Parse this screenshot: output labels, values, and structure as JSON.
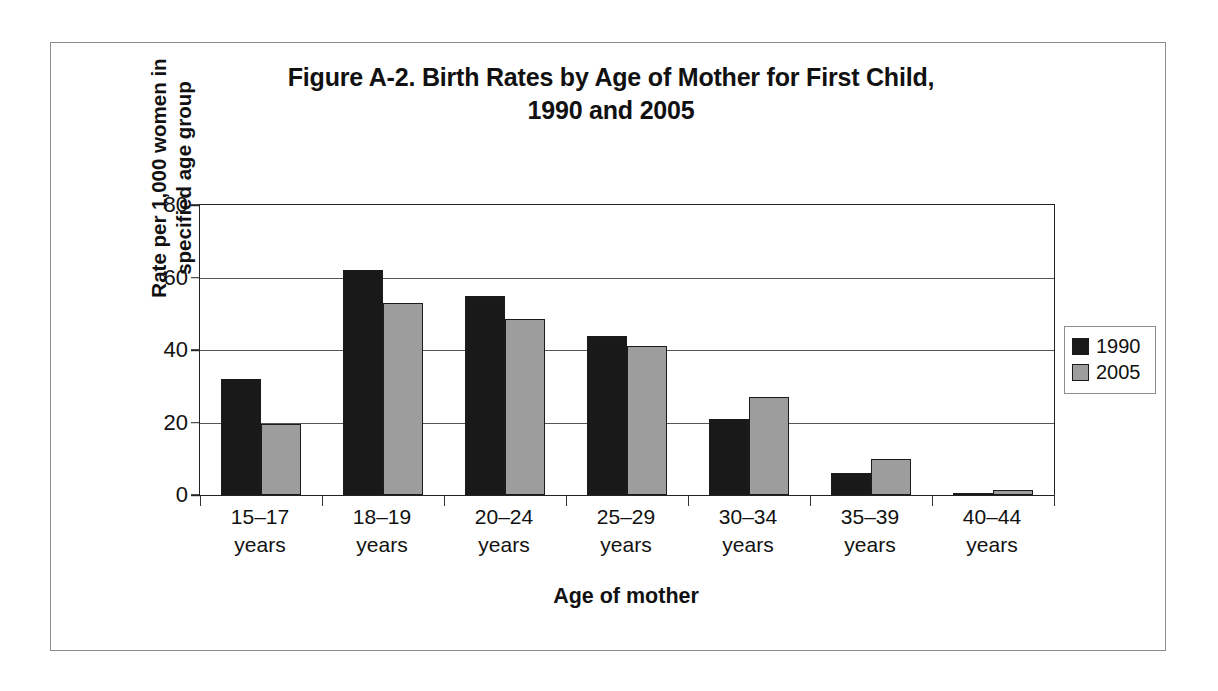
{
  "figure": {
    "title_line1": "Figure A-2. Birth Rates by Age of Mother for First Child,",
    "title_line2": "1990 and 2005",
    "y_axis_title_line1": "Rate per 1,000 women in",
    "y_axis_title_line2": "specified age group",
    "x_axis_title": "Age of mother"
  },
  "legend": {
    "position": "right",
    "items": [
      {
        "label": "1990",
        "color": "#191919"
      },
      {
        "label": "2005",
        "color": "#9d9d9d"
      }
    ]
  },
  "axis": {
    "y_ticks": [
      "80",
      "60",
      "40",
      "20",
      "0"
    ],
    "x_categories_line1": [
      "15–17",
      "18–19",
      "20–24",
      "25–29",
      "30–34",
      "35–39",
      "40–44"
    ],
    "x_categories_line2": [
      "years",
      "years",
      "years",
      "years",
      "years",
      "years",
      "years"
    ]
  },
  "chart_data": {
    "type": "bar",
    "title": "Figure A-2. Birth Rates by Age of Mother for First Child, 1990 and 2005",
    "xlabel": "Age of mother",
    "ylabel": "Rate per 1,000 women in specified age group",
    "ylim": [
      0,
      80
    ],
    "yticks": [
      0,
      20,
      40,
      60,
      80
    ],
    "grid": true,
    "legend_position": "right",
    "categories": [
      "15–17 years",
      "18–19 years",
      "20–24 years",
      "25–29 years",
      "30–34 years",
      "35–39 years",
      "40–44 years"
    ],
    "series": [
      {
        "name": "1990",
        "color": "#191919",
        "values": [
          32,
          62,
          55,
          44,
          21,
          6,
          0.6
        ]
      },
      {
        "name": "2005",
        "color": "#9d9d9d",
        "values": [
          19.5,
          53,
          48.5,
          41,
          27,
          10,
          1.3
        ]
      }
    ]
  }
}
